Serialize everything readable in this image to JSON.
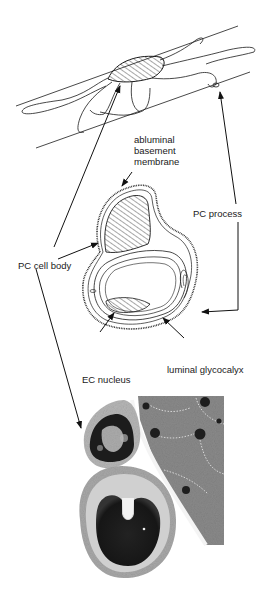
{
  "figure": {
    "labels": {
      "abluminal_line1": "abluminal",
      "abluminal_line2": "basement",
      "abluminal_line3": "membrane",
      "pc_process": "PC process",
      "pc_cell_body": "PC cell body",
      "ec_nucleus": "EC nucleus",
      "luminal_glycocalyx": "luminal glycocalyx"
    },
    "panels": [
      {
        "name": "capillary-longitudinal-sketch",
        "description": "Pericyte wrapping capillary with processes"
      },
      {
        "name": "capillary-cross-section-drawing",
        "description": "Cross-section showing PC cell body, EC nucleus, basement membrane"
      },
      {
        "name": "electron-micrograph",
        "description": "EM image of pericyte on capillary"
      }
    ],
    "colors": {
      "line": "#1a1a1a",
      "em_dark": "#1c1c1c",
      "em_mid": "#7a7a7a",
      "em_light": "#c8c8c8"
    }
  }
}
